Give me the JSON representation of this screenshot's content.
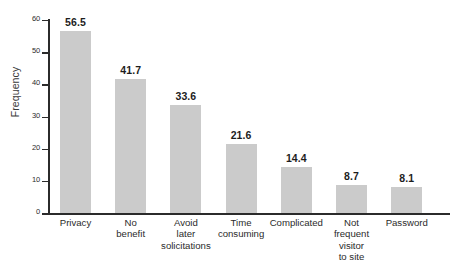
{
  "chart_data": {
    "type": "bar",
    "title": "",
    "xlabel": "",
    "ylabel": "Frequency",
    "ylim": [
      0,
      60
    ],
    "yticks": [
      0,
      10,
      20,
      30,
      40,
      50,
      60
    ],
    "ytick_labels": [
      "0",
      "10",
      "20",
      "30",
      "40",
      "50",
      "60"
    ],
    "grid": false,
    "legend": null,
    "bar_color": "#cbcbcb",
    "axis_color": "#2b2b2b",
    "categories": [
      "Privacy",
      "No benefit",
      "Avoid later solicitations",
      "Time consuming",
      "Complicated",
      "Not frequent visitor to site",
      "Password"
    ],
    "category_lines": [
      [
        "Privacy"
      ],
      [
        "No",
        "benefit"
      ],
      [
        "Avoid",
        "later",
        "solicitations"
      ],
      [
        "Time",
        "consuming"
      ],
      [
        "Complicated"
      ],
      [
        "Not",
        "frequent",
        "visitor",
        "to site"
      ],
      [
        "Password"
      ]
    ],
    "values": [
      56.5,
      41.7,
      33.6,
      21.6,
      14.4,
      8.7,
      8.1
    ],
    "data_labels": [
      "56.5",
      "41.7",
      "33.6",
      "21.6",
      "14.4",
      "8.7",
      "8.1"
    ]
  }
}
